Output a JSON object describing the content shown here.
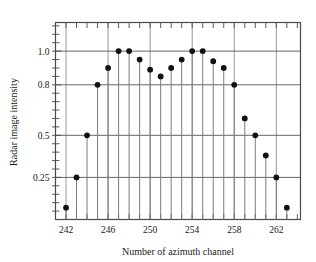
{
  "chart_data": {
    "type": "scatter",
    "title": "",
    "xlabel": "Number of azimuth channel",
    "ylabel": "Radar image intensity",
    "xlim": [
      241.0,
      264.3
    ],
    "ylim": [
      0.0,
      1.17
    ],
    "grid": true,
    "legend": null,
    "xticks": [
      242,
      246,
      250,
      254,
      258,
      262
    ],
    "xticklabels": [
      "242",
      "246",
      "250",
      "254",
      "258",
      "262"
    ],
    "xminor_step": 1,
    "yticks": [
      0.25,
      0.5,
      0.8,
      1.0
    ],
    "yticklabels": [
      "0.25",
      "0.5",
      "0.8",
      "1.0"
    ],
    "marker": "filled-circle",
    "stems": true,
    "x": [
      242,
      243,
      244,
      245,
      246,
      247,
      248,
      249,
      250,
      251,
      252,
      253,
      254,
      255,
      256,
      257,
      258,
      259,
      260,
      261,
      262,
      263
    ],
    "values": [
      0.07,
      0.25,
      0.5,
      0.8,
      0.9,
      1.0,
      1.0,
      0.95,
      0.89,
      0.85,
      0.9,
      0.95,
      1.0,
      1.0,
      0.94,
      0.9,
      0.8,
      0.6,
      0.5,
      0.38,
      0.25,
      0.07
    ]
  },
  "axes": {
    "x_title": "Number of azimuth channel",
    "y_title": "Radar image intensity"
  },
  "colors": {
    "marker": "#111111",
    "stem": "#7d7d7d",
    "grid": "#555555",
    "axis": "#4a4a4a",
    "background": "#ffffff"
  }
}
